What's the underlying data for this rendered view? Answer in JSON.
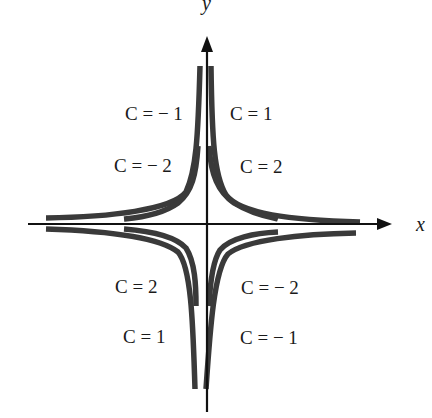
{
  "diagram": {
    "axes": {
      "x_label": "x",
      "y_label": "y"
    },
    "curve_labels": {
      "q2_outer": "C = − 1",
      "q1_outer": "C = 1",
      "q2_inner": "C = − 2",
      "q1_inner": "C = 2",
      "q3_inner": "C = 2",
      "q4_inner": "C = − 2",
      "q3_outer": "C = 1",
      "q4_outer": "C = − 1"
    },
    "colors": {
      "curve": "#3a3a3a",
      "axis": "#111111",
      "background": "#ffffff"
    }
  }
}
